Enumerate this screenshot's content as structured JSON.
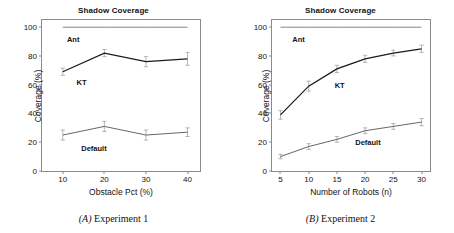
{
  "figure": {
    "panels": [
      {
        "id": "a",
        "title": "Shadow Coverage",
        "caption_tag": "(A)",
        "caption_text": "Experiment 1",
        "chart_data": {
          "type": "line",
          "title": "Shadow Coverage",
          "xlabel": "Obstacle Pct (%)",
          "ylabel": "Coverage (%)",
          "x": [
            10,
            20,
            30,
            40
          ],
          "xticks": [
            "10",
            "20",
            "30",
            "40"
          ],
          "yticks": [
            "0",
            "20",
            "40",
            "60",
            "80",
            "100"
          ],
          "xlim": [
            5,
            43
          ],
          "ylim": [
            0,
            105
          ],
          "grid": false,
          "legend": "inline-labels",
          "series": [
            {
              "name": "Ant",
              "values": [
                100,
                100,
                100,
                100
              ],
              "errors": [
                0,
                0,
                0,
                0
              ],
              "color": "#777777",
              "label_x": 12.5,
              "label_y": 92
            },
            {
              "name": "KT",
              "values": [
                69,
                82,
                76,
                78
              ],
              "errors": [
                2.5,
                2.5,
                3.5,
                4.5
              ],
              "color": "#1a1a1a",
              "label_x": 14.5,
              "label_y": 62
            },
            {
              "name": "Default",
              "values": [
                25,
                31,
                25,
                27
              ],
              "errors": [
                3.5,
                3.5,
                3.5,
                3.0
              ],
              "color": "#555555",
              "label_x": 17.5,
              "label_y": 16
            }
          ]
        }
      },
      {
        "id": "b",
        "title": "Shadow Coverage",
        "caption_tag": "(B)",
        "caption_text": "Experiment 2",
        "chart_data": {
          "type": "line",
          "title": "Shadow Coverage",
          "xlabel": "Number of Robots (n)",
          "ylabel": "Coverage (%)",
          "x": [
            5,
            10,
            15,
            20,
            25,
            30
          ],
          "xticks": [
            "5",
            "10",
            "15",
            "20",
            "25",
            "30"
          ],
          "yticks": [
            "0",
            "20",
            "40",
            "60",
            "80",
            "100"
          ],
          "xlim": [
            3.5,
            31.5
          ],
          "ylim": [
            0,
            105
          ],
          "grid": false,
          "legend": "inline-labels",
          "series": [
            {
              "name": "Ant",
              "values": [
                100,
                100,
                100,
                100,
                100,
                100
              ],
              "errors": [
                0,
                0,
                0,
                0,
                0,
                0
              ],
              "color": "#777777",
              "label_x": 8.2,
              "label_y": 92
            },
            {
              "name": "KT",
              "values": [
                39,
                59,
                71,
                78,
                82,
                85
              ],
              "errors": [
                3.0,
                3.5,
                2.5,
                2.5,
                2.0,
                2.5
              ],
              "color": "#1a1a1a",
              "label_x": 15.5,
              "label_y": 60
            },
            {
              "name": "Default",
              "values": [
                10,
                17,
                22,
                28,
                31,
                34
              ],
              "errors": [
                1.5,
                2.0,
                2.0,
                2.0,
                2.0,
                2.5
              ],
              "color": "#555555",
              "label_x": 20.5,
              "label_y": 20
            }
          ]
        }
      }
    ]
  }
}
